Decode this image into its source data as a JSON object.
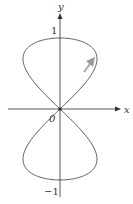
{
  "figure": {
    "x_axis_label": "x",
    "y_axis_label": "y",
    "tick_top": "1",
    "tick_bottom": "−1",
    "origin_label": "0",
    "curve": "x = sin 2t, y = sin t",
    "direction_arrow": "arrow-up-right"
  },
  "colors": {
    "axis": "#444444",
    "curve": "#555555",
    "arrow": "#999999"
  }
}
